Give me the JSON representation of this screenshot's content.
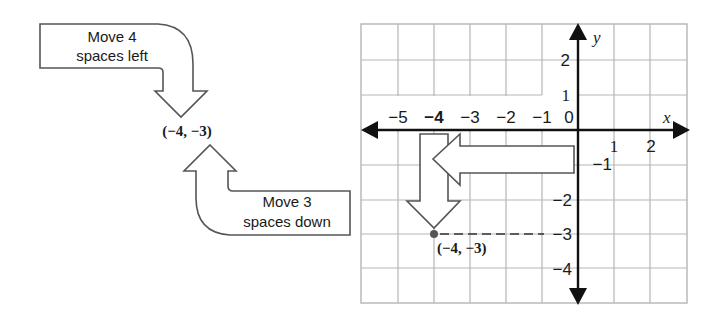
{
  "left_panel": {
    "callout_left": {
      "line1": "Move 4",
      "line2": "spaces left"
    },
    "point_label": "(−4, −3)",
    "callout_down": {
      "line1": "Move 3",
      "line2": "spaces down"
    }
  },
  "graph": {
    "x_axis_label": "x",
    "y_axis_label": "y",
    "x_ticks_negative": [
      "−5",
      "−4",
      "−3",
      "−2",
      "−1"
    ],
    "origin_label": "0",
    "x_ticks_positive": [
      "1",
      "2"
    ],
    "y_ticks_positive": [
      "2",
      "1"
    ],
    "y_ticks_negative": [
      "−1",
      "−2",
      "−3",
      "−4"
    ],
    "point": {
      "x": -4,
      "y": -3,
      "label": "(−4, −3)"
    },
    "colors": {
      "grid": "#b5b5b5",
      "axis": "#111111",
      "arrow_outline": "#555555",
      "point": "#555555"
    }
  }
}
